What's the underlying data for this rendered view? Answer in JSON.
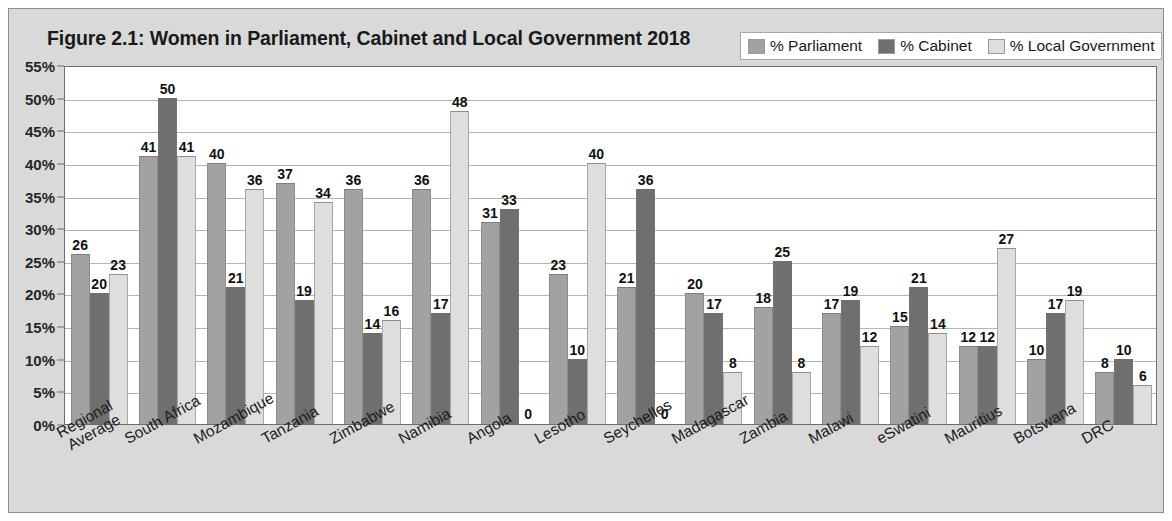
{
  "figure": {
    "title": "Figure 2.1: Women in Parliament, Cabinet and Local Government 2018",
    "border_color": "#8d8d8d",
    "background_color": "#d9d9d9"
  },
  "legend": {
    "items": [
      {
        "label": "% Parliament",
        "color": "#a2a2a2",
        "icon": "legend-swatch-icon"
      },
      {
        "label": "% Cabinet",
        "color": "#6f6f6f",
        "icon": "legend-swatch-icon"
      },
      {
        "label": "% Local Government",
        "color": "#dedede",
        "icon": "legend-swatch-icon"
      }
    ]
  },
  "chart_data": {
    "type": "bar",
    "title": "Figure 2.1: Women in Parliament, Cabinet and Local Government 2018",
    "xlabel": "",
    "ylabel": "",
    "ylim": [
      0,
      55
    ],
    "ytick_labels": [
      "55%",
      "50%",
      "45%",
      "40%",
      "35%",
      "30%",
      "25%",
      "20%",
      "15%",
      "10%",
      "5%",
      "0%"
    ],
    "ytick_values": [
      55,
      50,
      45,
      40,
      35,
      30,
      25,
      20,
      15,
      10,
      5,
      0
    ],
    "grid": true,
    "legend_position": "top-right",
    "categories": [
      "Regional Average",
      "South Africa",
      "Mozambique",
      "Tanzania",
      "Zimbabwe",
      "Namibia",
      "Angola",
      "Lesotho",
      "Seychelles",
      "Madagascar",
      "Zambia",
      "Malawi",
      "eSwatini",
      "Mauritius",
      "Botswana",
      "DRC"
    ],
    "category_lines": [
      [
        "Regional",
        "Average"
      ],
      [
        "South Africa"
      ],
      [
        "Mozambique"
      ],
      [
        "Tanzania"
      ],
      [
        "Zimbabwe"
      ],
      [
        "Namibia"
      ],
      [
        "Angola"
      ],
      [
        "Lesotho"
      ],
      [
        "Seychelles"
      ],
      [
        "Madagascar"
      ],
      [
        "Zambia"
      ],
      [
        "Malawi"
      ],
      [
        "eSwatini"
      ],
      [
        "Mauritius"
      ],
      [
        "Botswana"
      ],
      [
        "DRC"
      ]
    ],
    "series": [
      {
        "name": "% Parliament",
        "color": "#a2a2a2",
        "values": [
          26,
          41,
          40,
          37,
          36,
          36,
          31,
          23,
          21,
          20,
          18,
          17,
          15,
          12,
          10,
          8
        ]
      },
      {
        "name": "% Cabinet",
        "color": "#6f6f6f",
        "values": [
          20,
          50,
          21,
          19,
          14,
          17,
          33,
          10,
          36,
          17,
          25,
          19,
          21,
          12,
          17,
          10
        ]
      },
      {
        "name": "% Local Government",
        "color": "#dedede",
        "values": [
          23,
          41,
          36,
          34,
          16,
          48,
          0,
          40,
          0,
          8,
          8,
          12,
          14,
          27,
          19,
          6
        ]
      }
    ]
  }
}
